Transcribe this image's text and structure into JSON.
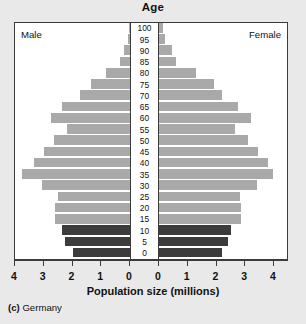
{
  "chart_data": {
    "type": "bar",
    "subtype": "population-pyramid",
    "title": "Age",
    "xlabel": "Population size (millions)",
    "ylabel": "Age",
    "caption_tag": "(c)",
    "caption_name": "Germany",
    "left_label": "Male",
    "right_label": "Female",
    "grid": false,
    "legend_position": "none",
    "xlim": [
      0,
      4
    ],
    "x_tick_labels_left": [
      "4",
      "3",
      "2",
      "1",
      "0"
    ],
    "x_tick_labels_right": [
      "0",
      "1",
      "2",
      "3",
      "4"
    ],
    "x_tick_values": [
      4,
      3,
      2,
      1,
      0
    ],
    "categories": [
      "100",
      "95",
      "90",
      "85",
      "80",
      "75",
      "70",
      "65",
      "60",
      "55",
      "50",
      "45",
      "40",
      "35",
      "30",
      "25",
      "20",
      "15",
      "10",
      "5",
      "0"
    ],
    "age_tick_labels": [
      "100",
      "95",
      "90",
      "85",
      "80",
      "75",
      "70",
      "65",
      "60",
      "55",
      "50",
      "45",
      "40",
      "35",
      "30",
      "25",
      "20",
      "15",
      "10",
      "5",
      "0"
    ],
    "series": [
      {
        "name": "Male",
        "side": "left",
        "values": [
          0.03,
          0.08,
          0.2,
          0.35,
          0.85,
          1.35,
          1.75,
          2.35,
          2.75,
          2.2,
          2.65,
          3.0,
          3.35,
          3.75,
          3.05,
          2.5,
          2.6,
          2.6,
          2.35,
          2.25,
          2.0
        ]
      },
      {
        "name": "Female",
        "side": "right",
        "values": [
          0.14,
          0.2,
          0.44,
          0.58,
          1.3,
          1.9,
          2.2,
          2.75,
          3.2,
          2.65,
          3.1,
          3.45,
          3.8,
          3.95,
          3.4,
          2.8,
          2.85,
          2.85,
          2.5,
          2.4,
          2.2
        ]
      }
    ],
    "bar_colors": {
      "adult": "#a9a9a9",
      "youth": "#3c3c3c"
    },
    "youth_categories": [
      "10",
      "5",
      "0"
    ],
    "frame_color": "#3b3b3b",
    "plot_background": "#ffffff",
    "figure_background": "#e9e9e9"
  }
}
